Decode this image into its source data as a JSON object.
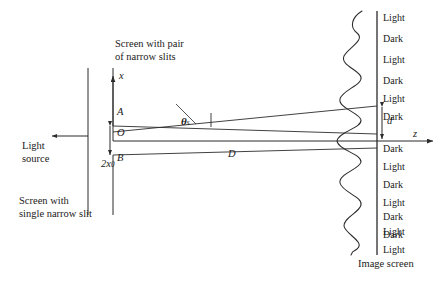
{
  "figure": {
    "stroke_color": "#2b2b2b",
    "text_color": "#1a1a1a",
    "background": "#ffffff"
  },
  "annotations": {
    "double_slit_caption_line1": "Screen with pair",
    "double_slit_caption_line2": "of narrow slits",
    "single_slit_caption_line1": "Screen with",
    "single_slit_caption_line2": "single narrow slit",
    "light_source_line1": "Light",
    "light_source_line2": "source",
    "image_screen_caption": "Image screen"
  },
  "symbols": {
    "x_axis": "x",
    "z_axis": "z",
    "slit_top": "A",
    "slit_origin": "O",
    "slit_bottom": "B",
    "slit_separation": "2x",
    "slit_separation_sub": "0",
    "distance": "D",
    "fringe_spacing": "d",
    "theta": "θ",
    "theta_sub": "s"
  },
  "fringes": {
    "above_axis": [
      {
        "label": "Light"
      },
      {
        "label": "Dark"
      },
      {
        "label": "Light"
      },
      {
        "label": "Dark"
      },
      {
        "label": "Light"
      },
      {
        "label": "Dark"
      }
    ],
    "below_axis": [
      {
        "label": "Dark"
      },
      {
        "label": "Light"
      },
      {
        "label": "Dark"
      },
      {
        "label": "Light"
      },
      {
        "label": "Dark"
      },
      {
        "label": "Light"
      },
      {
        "label": "Dark"
      },
      {
        "label": "Light"
      }
    ]
  },
  "geometry": {
    "single_slit_screen_x": 88,
    "double_slit_screen_x": 113,
    "image_screen_x": 377,
    "axis_y": 141,
    "slit_A_y": 126,
    "slit_B_y": 155,
    "fringe_spacing_px": 29
  }
}
